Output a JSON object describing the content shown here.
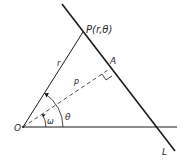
{
  "diagram": {
    "type": "geometry",
    "labels": {
      "point_P": "P(r,θ)",
      "point_A": "A",
      "origin": "O",
      "line": "L",
      "segment_r": "r",
      "segment_p": "p",
      "angle_theta": "θ",
      "angle_omega": "ω"
    },
    "colors": {
      "stroke": "#1a1a1a",
      "text": "#2a2a2a",
      "background": "#ffffff"
    }
  }
}
